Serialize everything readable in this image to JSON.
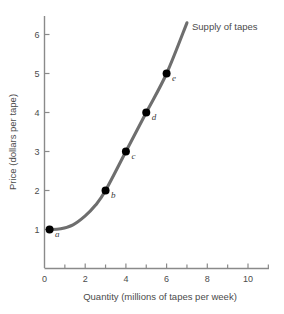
{
  "chart_data": {
    "type": "line",
    "title": "",
    "xlabel": "Quantity (millions of tapes per week)",
    "ylabel": "Price (dollars per tape)",
    "xlim": [
      0,
      11
    ],
    "ylim": [
      0,
      6.5
    ],
    "grid": false,
    "legend_position": "inside-top-right",
    "series": [
      {
        "name": "Supply of tapes",
        "color": "#6e6e6e",
        "x": [
          0.25,
          0.8,
          1.4,
          2.0,
          2.5,
          3.0,
          4.0,
          5.0,
          6.0,
          7.0
        ],
        "y": [
          1.0,
          1.02,
          1.12,
          1.35,
          1.62,
          2.0,
          3.0,
          4.0,
          5.0,
          6.3
        ]
      }
    ],
    "points": [
      {
        "label": "a",
        "x": 0.25,
        "y": 1
      },
      {
        "label": "b",
        "x": 3,
        "y": 2
      },
      {
        "label": "c",
        "x": 4,
        "y": 3
      },
      {
        "label": "d",
        "x": 5,
        "y": 4
      },
      {
        "label": "e",
        "x": 6,
        "y": 5
      }
    ],
    "point_color": "#000000",
    "xticks": [
      0,
      2,
      4,
      6,
      8,
      10
    ],
    "xtick_labels": [
      "0",
      "2",
      "4",
      "6",
      "8",
      "10"
    ],
    "xminor_ticks": [
      1,
      3,
      5,
      7,
      9,
      11
    ],
    "yticks": [
      1,
      2,
      3,
      4,
      5,
      6
    ],
    "ytick_labels": [
      "1",
      "2",
      "3",
      "4",
      "5",
      "6"
    ],
    "axis_color": "#8a8a8a"
  },
  "legend": {
    "series_label": "Supply of tapes"
  }
}
